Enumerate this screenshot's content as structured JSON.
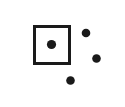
{
  "canvas": {
    "width": 125,
    "height": 107,
    "background_color": "#ffffff",
    "title": "Square and Dots Diagram"
  },
  "style": {
    "ink_color": "#1a1a1a",
    "square_fill": "#ffffff",
    "square_stroke_width": 3
  },
  "shapes": {
    "square": {
      "label": "square-outline",
      "x": 34.5,
      "y": 26.5,
      "width": 35,
      "height": 37,
      "stroke_width": 3,
      "stroke_color": "#1a1a1a",
      "fill_color": "#ffffff"
    },
    "dots": [
      {
        "label": "center-dot",
        "position": "inside-square-center",
        "cx": 51.5,
        "cy": 44.5,
        "r": 4.6,
        "color": "#1a1a1a"
      },
      {
        "label": "dot-upper-right",
        "position": "outside-upper-right",
        "cx": 86,
        "cy": 33,
        "r": 4.3,
        "color": "#1a1a1a"
      },
      {
        "label": "dot-middle-right",
        "position": "outside-middle-right",
        "cx": 96.5,
        "cy": 58.5,
        "r": 4.3,
        "color": "#1a1a1a"
      },
      {
        "label": "dot-lower-center",
        "position": "outside-below",
        "cx": 70.5,
        "cy": 80.5,
        "r": 4.3,
        "color": "#1a1a1a"
      }
    ]
  },
  "counts": {
    "squares": 1,
    "dots_total": 4,
    "dots_inside_square": 1,
    "dots_outside_square": 3
  }
}
